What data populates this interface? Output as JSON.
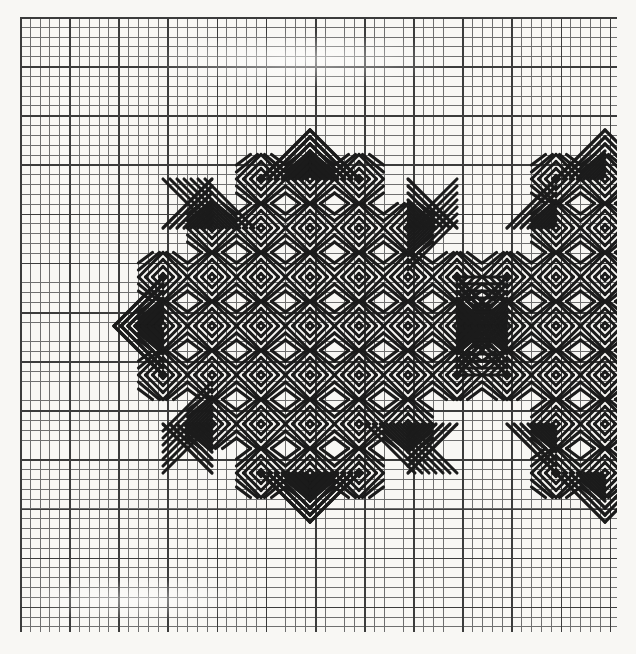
{
  "document": {
    "kind": "needlepoint-chart",
    "title": "Eight-pointed star needlepoint pattern chart",
    "medium": "printed graph paper chart",
    "ink_color": "#1b1b1b",
    "paper_color": "#f8f7f4",
    "grid_fine_line_color": "#6f6f6f",
    "grid_heavy_line_color": "#3c3c3c"
  },
  "grid": {
    "origin_x": 20,
    "origin_y": 17,
    "cell_px": 9.83,
    "heavy_every": 5,
    "columns": 60,
    "rows": 62,
    "width_px": 597,
    "height_px": 615
  },
  "chart_data": {
    "type": "heatmap",
    "title": "Eight-pointed star needlepoint pattern chart",
    "xlabel": "",
    "ylabel": "",
    "grid": true,
    "legend": "none",
    "unit_block_cells": 5,
    "unit_block_px": 49.15,
    "stitch_color": "#1b1b1b",
    "motifs": [
      {
        "name": "primary-star",
        "kind": "eight-pointed-star",
        "center_px": [
          310,
          326
        ],
        "core_half_px": 147,
        "point_length_px": 98,
        "points": 8
      },
      {
        "name": "repeat-star-right",
        "kind": "eight-pointed-star",
        "center_px": [
          605,
          326
        ],
        "core_half_px": 147,
        "point_length_px": 98,
        "points": 8,
        "clipped": "right edge of chart"
      }
    ],
    "blocks": [
      {
        "cx": 261,
        "cy": 277,
        "style": "diamond-chevron"
      },
      {
        "cx": 310,
        "cy": 277,
        "style": "diamond-chevron"
      },
      {
        "cx": 359,
        "cy": 277,
        "style": "diamond-chevron"
      },
      {
        "cx": 261,
        "cy": 326,
        "style": "diamond-chevron"
      },
      {
        "cx": 310,
        "cy": 326,
        "style": "diamond-chevron"
      },
      {
        "cx": 359,
        "cy": 326,
        "style": "diamond-chevron"
      },
      {
        "cx": 261,
        "cy": 375,
        "style": "diamond-chevron"
      },
      {
        "cx": 310,
        "cy": 375,
        "style": "diamond-chevron"
      },
      {
        "cx": 359,
        "cy": 375,
        "style": "diamond-chevron"
      }
    ]
  },
  "annotations": {
    "none": ""
  }
}
